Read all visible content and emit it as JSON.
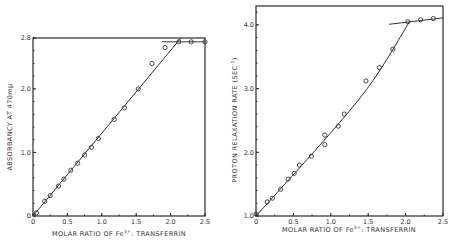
{
  "chart_data": [
    {
      "type": "scatter",
      "title": "",
      "xlabel": "MOLAR RATIO OF Fe3+: TRANSFERRIN",
      "ylabel": "ABSORBANCY AT 470mμ",
      "xlim": [
        0,
        2.5
      ],
      "ylim": [
        0,
        2.8
      ],
      "x_ticks": [
        "0",
        "0.5",
        "1.0",
        "1.5",
        "2.0",
        "2.5"
      ],
      "y_ticks": [
        "0",
        "1.0",
        "2.0",
        "2.8"
      ],
      "grid": false,
      "series": [
        {
          "name": "measured",
          "x": [
            0.05,
            0.17,
            0.25,
            0.37,
            0.45,
            0.55,
            0.65,
            0.75,
            0.85,
            0.95,
            1.18,
            1.33,
            1.53,
            1.73,
            1.92,
            2.12,
            2.3,
            2.5
          ],
          "y": [
            0.05,
            0.23,
            0.32,
            0.47,
            0.58,
            0.72,
            0.83,
            0.96,
            1.08,
            1.22,
            1.52,
            1.7,
            2.0,
            2.4,
            2.65,
            2.74,
            2.74,
            2.74
          ]
        },
        {
          "name": "linear fit",
          "x": [
            0,
            2.15
          ],
          "y": [
            0,
            2.8
          ]
        },
        {
          "name": "plateau",
          "x": [
            1.87,
            2.5
          ],
          "y": [
            2.74,
            2.74
          ]
        }
      ]
    },
    {
      "type": "scatter",
      "title": "",
      "xlabel": "MOLAR RATIO OF Fe3+: TRANSFERRIN",
      "ylabel": "PROTON RELAXATION RATE (SEC-1)",
      "xlim": [
        0,
        2.5
      ],
      "ylim": [
        1.0,
        4.3
      ],
      "x_ticks": [
        "0",
        "0.5",
        "1.0",
        "1.5",
        "2.0",
        "2.5"
      ],
      "y_ticks": [
        "1.0",
        "2.0",
        "3.0",
        "4.0"
      ],
      "grid": false,
      "series": [
        {
          "name": "measured",
          "x": [
            0.0,
            0.15,
            0.22,
            0.33,
            0.43,
            0.51,
            0.58,
            0.74,
            0.92,
            0.92,
            1.1,
            1.18,
            1.47,
            1.65,
            1.83,
            2.03,
            2.2,
            2.37
          ],
          "y": [
            1.03,
            1.22,
            1.28,
            1.42,
            1.58,
            1.67,
            1.8,
            1.94,
            2.12,
            2.27,
            2.41,
            2.6,
            3.12,
            3.33,
            3.62,
            4.05,
            4.08,
            4.1
          ]
        },
        {
          "name": "fit curve",
          "x": [
            0,
            0.5,
            1.0,
            1.5,
            1.8,
            2.05
          ],
          "y": [
            1.0,
            1.65,
            2.3,
            3.0,
            3.55,
            4.05
          ]
        },
        {
          "name": "plateau",
          "x": [
            1.78,
            2.5
          ],
          "y": [
            4.01,
            4.11
          ]
        }
      ]
    }
  ],
  "left": {
    "xlabel": "MOLAR RATIO OF Fe",
    "xlabel_sup": "3+",
    "xlabel_rest": ": TRANSFERRIN",
    "ylabel": "ABSORBANCY AT 470mμ",
    "x_ticks": [
      "0",
      "0.5",
      "1.0",
      "1.5",
      "2.0",
      "2.5"
    ],
    "y_ticks": [
      "0",
      "1.0",
      "2.0",
      "2.8"
    ]
  },
  "right": {
    "xlabel": "MOLAR RATIO OF Fe",
    "xlabel_sup": "3+",
    "xlabel_rest": ": TRANSFERRIN",
    "ylabel": "PROTON RELAXATION RATE (SEC",
    "ylabel_sup": "-1",
    "ylabel_end": ")",
    "x_ticks": [
      "0",
      "0.5",
      "1.0",
      "1.5",
      "2.0",
      "2.5"
    ],
    "y_ticks": [
      "1.0",
      "2.0",
      "3.0",
      "4.0"
    ]
  }
}
